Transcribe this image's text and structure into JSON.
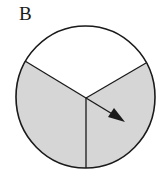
{
  "figure": {
    "label": "B",
    "type": "spinner",
    "sectors": [
      {
        "name": "top",
        "fill": "#ffffff",
        "shaded": false
      },
      {
        "name": "bottom-left",
        "fill": "#d6d6d6",
        "shaded": true
      },
      {
        "name": "bottom-right",
        "fill": "#d6d6d6",
        "shaded": true
      }
    ],
    "colors": {
      "outline": "#1a1a1a",
      "shade": "#d6d6d6",
      "background": "#ffffff"
    }
  }
}
